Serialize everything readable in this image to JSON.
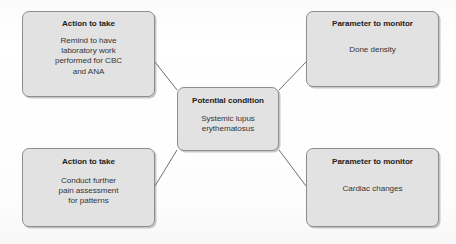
{
  "diagram": {
    "type": "concept-map",
    "center": {
      "id": "potential-condition",
      "title": "Potential condition",
      "body": "Systemic lupus\nerythematosus",
      "body_lines": [
        "Systemic lupus",
        "erythematosus"
      ]
    },
    "nodes": [
      {
        "id": "action-labs",
        "position": "top-left",
        "title": "Action to take",
        "body": "Remind to have laboratory work performed for CBC and ANA",
        "body_lines": [
          "Remind to have",
          "laboratory work",
          "performed for CBC",
          "and ANA"
        ]
      },
      {
        "id": "param-bone-density",
        "position": "top-right",
        "title": "Parameter to monitor",
        "body": "Done density",
        "body_lines": [
          "Done density"
        ]
      },
      {
        "id": "action-pain",
        "position": "bottom-left",
        "title": "Action to take",
        "body": "Conduct further pain assessment for patterns",
        "body_lines": [
          "Conduct further",
          "pain assessment",
          "for patterns"
        ]
      },
      {
        "id": "param-cardiac",
        "position": "bottom-right",
        "title": "Parameter to monitor",
        "body": "Cardiac changes",
        "body_lines": [
          "Cardiac changes"
        ]
      }
    ],
    "connectors": [
      {
        "id": "connector-top-left",
        "from": "potential-condition",
        "to": "action-labs"
      },
      {
        "id": "connector-top-right",
        "from": "potential-condition",
        "to": "param-bone-density"
      },
      {
        "id": "connector-bottom-left",
        "from": "potential-condition",
        "to": "action-pain"
      },
      {
        "id": "connector-bottom-right",
        "from": "potential-condition",
        "to": "param-cardiac"
      }
    ],
    "colors": {
      "box_fill": "#e2e2e2",
      "box_border": "#8d8d8d",
      "text": "#2f2f2f",
      "title_text": "#222222",
      "connector_line": "#6f6f6f",
      "page_background": "#fdfdfd"
    }
  }
}
